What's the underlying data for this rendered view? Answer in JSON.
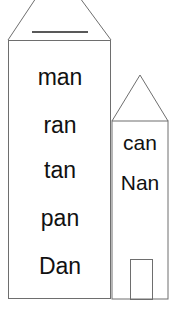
{
  "big_house": {
    "words": [
      "man",
      "ran",
      "tan",
      "pan",
      "Dan"
    ]
  },
  "small_house": {
    "words": [
      "can",
      "Nan"
    ]
  },
  "colors": {
    "line": "#6e6e6e",
    "text": "#111111",
    "background": "#ffffff"
  }
}
